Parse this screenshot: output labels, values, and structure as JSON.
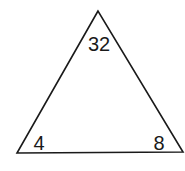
{
  "diagram": {
    "shape": "triangle",
    "stroke_color": "#1a1a1a",
    "vertices": {
      "top": {
        "x": 98,
        "y": 11
      },
      "bottom_left": {
        "x": 17,
        "y": 153
      },
      "bottom_right": {
        "x": 183,
        "y": 152
      }
    },
    "labels": {
      "top": "32",
      "bottom_left": "4",
      "bottom_right": "8"
    }
  }
}
